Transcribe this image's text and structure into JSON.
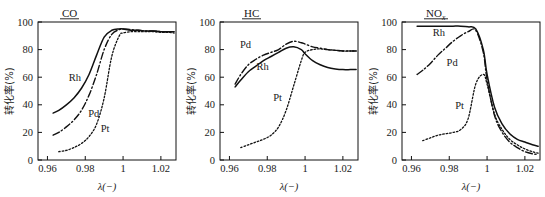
{
  "figure": {
    "background": "#ffffff",
    "ink": "#111111"
  },
  "axis": {
    "x_ticks": [
      "0.96",
      "0.98",
      "1",
      "1.02"
    ],
    "x_tick_values": [
      0.96,
      0.98,
      1.0,
      1.02
    ],
    "y_ticks": [
      "0",
      "20",
      "40",
      "60",
      "80",
      "100"
    ],
    "y_tick_values": [
      0,
      20,
      40,
      60,
      80,
      100
    ],
    "xlabel": "λ(−)",
    "ylabel": "转化率(%)",
    "xlim": [
      0.955,
      1.028
    ],
    "ylim": [
      0,
      100
    ]
  },
  "legend": {
    "rh": "Rh",
    "pd": "Pd",
    "pt": "Pt"
  },
  "panels": [
    {
      "id": "co",
      "title": "CO",
      "title_sub": ""
    },
    {
      "id": "hc",
      "title": "HC",
      "title_sub": ""
    },
    {
      "id": "nox",
      "title": "NO",
      "title_sub": "x"
    }
  ],
  "chart_data": [
    {
      "type": "line",
      "title": "CO",
      "xlabel": "λ(−)",
      "ylabel": "转化率(%)",
      "xlim": [
        0.955,
        1.028
      ],
      "ylim": [
        0,
        100
      ],
      "grid": false,
      "legend_position": "inline-curve-labels",
      "x": [
        0.963,
        0.966,
        0.97,
        0.974,
        0.978,
        0.982,
        0.986,
        0.99,
        0.994,
        0.998,
        1.0,
        1.004,
        1.008,
        1.012,
        1.016,
        1.02,
        1.024,
        1.027
      ],
      "series": [
        {
          "name": "Rh",
          "style": "solid",
          "values": [
            34,
            36,
            40,
            45,
            52,
            62,
            76,
            89,
            94,
            95,
            95,
            94,
            94,
            93.5,
            93.5,
            93,
            93,
            93
          ]
        },
        {
          "name": "Pd",
          "style": "dash-dot",
          "values": [
            18,
            20,
            24,
            29,
            36,
            47,
            62,
            80,
            91,
            94.5,
            95,
            94.5,
            94,
            93.5,
            93.5,
            93,
            93,
            93
          ]
        },
        {
          "name": "Pt",
          "style": "dotted",
          "values": [
            null,
            6,
            7,
            9,
            12,
            17,
            26,
            45,
            75,
            90,
            92,
            93,
            93,
            93,
            93,
            92.5,
            92.5,
            92
          ]
        }
      ]
    },
    {
      "type": "line",
      "title": "HC",
      "xlabel": "λ(−)",
      "ylabel": "转化率(%)",
      "xlim": [
        0.955,
        1.028
      ],
      "ylim": [
        0,
        100
      ],
      "grid": false,
      "legend_position": "inline-curve-labels",
      "x": [
        0.963,
        0.966,
        0.97,
        0.974,
        0.978,
        0.982,
        0.986,
        0.99,
        0.994,
        0.998,
        1.0,
        1.004,
        1.008,
        1.012,
        1.016,
        1.02,
        1.024,
        1.027
      ],
      "series": [
        {
          "name": "Rh",
          "style": "solid",
          "values": [
            53,
            58,
            64,
            68,
            72,
            75,
            78,
            81,
            82,
            80,
            77,
            72,
            69,
            67,
            66,
            65.5,
            65.5,
            65.5
          ]
        },
        {
          "name": "Pd",
          "style": "dash-dot",
          "values": [
            55,
            62,
            69,
            73,
            76,
            78,
            80,
            84,
            86,
            85,
            84,
            82,
            81,
            80,
            79.5,
            79,
            79,
            79
          ]
        },
        {
          "name": "Pt",
          "style": "dotted",
          "values": [
            null,
            9,
            11,
            13,
            15,
            18,
            24,
            36,
            54,
            72,
            78,
            80,
            80.5,
            80,
            79.5,
            79,
            79,
            79
          ]
        }
      ]
    },
    {
      "type": "line",
      "title": "NOx",
      "xlabel": "λ(−)",
      "ylabel": "转化率(%)",
      "xlim": [
        0.955,
        1.028
      ],
      "ylim": [
        0,
        100
      ],
      "grid": false,
      "legend_position": "inline-curve-labels",
      "x": [
        0.963,
        0.966,
        0.97,
        0.974,
        0.978,
        0.982,
        0.986,
        0.99,
        0.994,
        0.998,
        1.0,
        1.004,
        1.008,
        1.012,
        1.016,
        1.02,
        1.024,
        1.027
      ],
      "series": [
        {
          "name": "Rh",
          "style": "solid",
          "values": [
            97,
            97,
            97,
            97,
            97,
            97,
            97,
            96.5,
            95,
            80,
            62,
            38,
            26,
            19,
            15,
            13,
            11,
            10
          ]
        },
        {
          "name": "Pd",
          "style": "dash-dot",
          "values": [
            62,
            65,
            70,
            76,
            81,
            86,
            90,
            93,
            94,
            78,
            58,
            32,
            20,
            13,
            9,
            6,
            4.5,
            4
          ]
        },
        {
          "name": "Pt",
          "style": "dotted",
          "values": [
            null,
            14,
            16,
            18,
            19,
            20,
            22,
            30,
            55,
            62,
            55,
            33,
            22,
            15,
            11,
            8,
            6,
            5
          ]
        }
      ]
    }
  ]
}
